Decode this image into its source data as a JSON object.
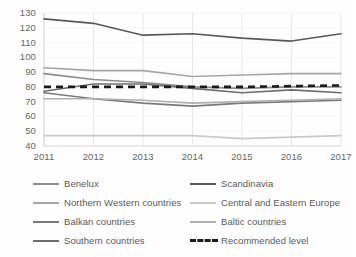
{
  "chart_data": {
    "type": "line",
    "title": "",
    "subtitle": "",
    "xlabel": "",
    "ylabel": "",
    "x": [
      2011,
      2012,
      2013,
      2014,
      2015,
      2016,
      2017
    ],
    "categories": [
      "2011",
      "2012",
      "2013",
      "2014",
      "2015",
      "2016",
      "2017"
    ],
    "xtick_labels": [
      "2011",
      "2012",
      "2013",
      "2014",
      "2015",
      "2016",
      "2017"
    ],
    "ytick_labels": [
      "130",
      "120",
      "110",
      "100",
      "90",
      "80",
      "70",
      "60",
      "50",
      "40"
    ],
    "yticks": [
      130,
      120,
      110,
      100,
      90,
      80,
      70,
      60,
      50,
      40
    ],
    "ylim": [
      40,
      130
    ],
    "xlim": [
      2011,
      2017
    ],
    "grid": "vertical-only",
    "legend_position": "bottom",
    "legend_columns": 2,
    "series": [
      {
        "name": "Benelux",
        "color": "#8c8c8c",
        "style": "solid",
        "values": [
          89,
          85,
          83,
          80,
          79,
          80,
          80
        ]
      },
      {
        "name": "Scandinavia",
        "color": "#595959",
        "style": "solid",
        "values": [
          126,
          123,
          115,
          116,
          113,
          111,
          116
        ]
      },
      {
        "name": "Northern Western countries",
        "color": "#a6a6a6",
        "style": "solid",
        "values": [
          93,
          91,
          91,
          87,
          88,
          89,
          89
        ]
      },
      {
        "name": "Central and Eastern Europe",
        "color": "#c9c9c9",
        "style": "solid",
        "values": [
          47,
          47,
          47,
          47,
          45,
          46,
          47
        ]
      },
      {
        "name": "Balkan countries",
        "color": "#7a7a7a",
        "style": "solid",
        "values": [
          76,
          72,
          69,
          67,
          69,
          70,
          71
        ]
      },
      {
        "name": "Baltic countries",
        "color": "#b0b0b0",
        "style": "solid",
        "values": [
          72,
          72,
          71,
          69,
          70,
          71,
          72
        ]
      },
      {
        "name": "Southern countries",
        "color": "#6e6e6e",
        "style": "solid",
        "values": [
          77,
          82,
          82,
          79,
          76,
          78,
          76
        ]
      },
      {
        "name": "Recommended level",
        "color": "#1a1a1a",
        "style": "dashed",
        "values": [
          80,
          80,
          80,
          80,
          80,
          80.5,
          81
        ]
      }
    ]
  },
  "legend": {
    "rows": [
      {
        "left_label": "Benelux",
        "right_label": "Scandinavia"
      },
      {
        "left_label": "Northern Western countries",
        "right_label": "Central and Eastern Europe"
      },
      {
        "left_label": "Balkan countries",
        "right_label": "Baltic countries"
      },
      {
        "left_label": "Southern countries",
        "right_label": "Recommended level"
      }
    ]
  },
  "colors": {
    "background": "#ffffff",
    "axis": "#d9d9d9",
    "gridline": "#e8e8e8",
    "tick_text": "#666666",
    "legend_text": "#5a5a5a"
  }
}
